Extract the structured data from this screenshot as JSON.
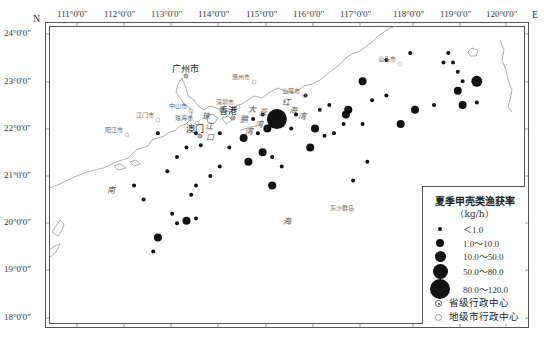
{
  "map": {
    "north_label": "N",
    "east_label": "E",
    "lon_ticks": [
      {
        "label": "111°0'0\"",
        "x": 77
      },
      {
        "label": "112°0'0\"",
        "x": 124
      },
      {
        "label": "113°0'0\"",
        "x": 171
      },
      {
        "label": "114°0'0\"",
        "x": 218
      },
      {
        "label": "115°0'0\"",
        "x": 266
      },
      {
        "label": "116°0'0\"",
        "x": 313
      },
      {
        "label": "117°0'0\"",
        "x": 360
      },
      {
        "label": "118°0'0\"",
        "x": 413
      },
      {
        "label": "119°0'0\"",
        "x": 460
      },
      {
        "label": "120°0'0\"",
        "x": 506
      }
    ],
    "lat_ticks": [
      {
        "label": "24°0'0\"",
        "y": 34
      },
      {
        "label": "23°0'0\"",
        "y": 82
      },
      {
        "label": "22°0'0\"",
        "y": 129
      },
      {
        "label": "21°0'0\"",
        "y": 176
      },
      {
        "label": "20°0'0\"",
        "y": 223
      },
      {
        "label": "19°0'0\"",
        "y": 270
      },
      {
        "label": "18°0'0\"",
        "y": 318
      }
    ],
    "cities": [
      {
        "name": "广州市",
        "x": 172,
        "y": 62,
        "type": "provincial",
        "big": true
      },
      {
        "name": "惠州市",
        "x": 232,
        "y": 72,
        "type": "prefecture",
        "big": false
      },
      {
        "name": "汕尾市",
        "x": 282,
        "y": 86,
        "type": "prefecture",
        "big": false
      },
      {
        "name": "汕头市",
        "x": 378,
        "y": 54,
        "type": "prefecture",
        "big": false
      },
      {
        "name": "深圳市",
        "x": 216,
        "y": 97,
        "type": "prefecture",
        "big": false
      },
      {
        "name": "中山市",
        "x": 169,
        "y": 101,
        "type": "prefecture",
        "big": false
      },
      {
        "name": "江门市",
        "x": 136,
        "y": 110,
        "type": "prefecture",
        "big": false
      },
      {
        "name": "珠海市",
        "x": 175,
        "y": 113,
        "type": "prefecture",
        "big": false
      },
      {
        "name": "香港",
        "x": 219,
        "y": 104,
        "type": "provincial",
        "big": true
      },
      {
        "name": "澳门",
        "x": 186,
        "y": 122,
        "type": "provincial",
        "big": true
      },
      {
        "name": "阳江市",
        "x": 105,
        "y": 125,
        "type": "prefecture",
        "big": false
      },
      {
        "name": "东沙群岛",
        "x": 330,
        "y": 203,
        "type": "island",
        "big": false
      }
    ],
    "sea_labels": [
      {
        "text": "南",
        "x": 107,
        "y": 184
      },
      {
        "text": "海",
        "x": 283,
        "y": 215
      },
      {
        "text": "珠",
        "x": 202,
        "y": 110
      },
      {
        "text": "江",
        "x": 205,
        "y": 120
      },
      {
        "text": "口",
        "x": 206,
        "y": 131
      },
      {
        "text": "大",
        "x": 248,
        "y": 103
      },
      {
        "text": "亚",
        "x": 259,
        "y": 106
      },
      {
        "text": "湾",
        "x": 255,
        "y": 118
      },
      {
        "text": "鹏",
        "x": 240,
        "y": 113
      },
      {
        "text": "湾",
        "x": 245,
        "y": 125
      },
      {
        "text": "红",
        "x": 282,
        "y": 96
      },
      {
        "text": "海",
        "x": 289,
        "y": 104
      },
      {
        "text": "湾",
        "x": 298,
        "y": 110
      }
    ]
  },
  "chart_data": {
    "type": "scatter",
    "title": "夏季甲壳类渔获率",
    "unit": "kg/h",
    "xlabel": "Longitude (°E)",
    "ylabel": "Latitude (°N)",
    "xlim": [
      110.4,
      120.3
    ],
    "ylim": [
      17.7,
      24.2
    ],
    "size_classes": [
      "<1.0",
      "1.0~10.0",
      "10.0~50.0",
      "50.0~80.0",
      "80.0~120.0"
    ],
    "stations": [
      {
        "lon": 115.2,
        "lat": 22.2,
        "class": "80.0~120.0"
      },
      {
        "lon": 119.4,
        "lat": 23.0,
        "class": "10.0~50.0"
      },
      {
        "lon": 119.0,
        "lat": 22.8,
        "class": "1.0~10.0"
      },
      {
        "lon": 119.1,
        "lat": 22.5,
        "class": "1.0~10.0"
      },
      {
        "lon": 118.5,
        "lat": 22.5,
        "class": "<1.0"
      },
      {
        "lon": 119.4,
        "lat": 22.55,
        "class": "<1.0"
      },
      {
        "lon": 119.0,
        "lat": 23.2,
        "class": "<1.0"
      },
      {
        "lon": 119.1,
        "lat": 23.0,
        "class": "<1.0"
      },
      {
        "lon": 118.7,
        "lat": 23.4,
        "class": "<1.0"
      },
      {
        "lon": 118.8,
        "lat": 23.6,
        "class": "<1.0"
      },
      {
        "lon": 118.9,
        "lat": 23.4,
        "class": "<1.0"
      },
      {
        "lon": 118.0,
        "lat": 23.6,
        "class": "<1.0"
      },
      {
        "lon": 117.5,
        "lat": 23.45,
        "class": "<1.0"
      },
      {
        "lon": 117.0,
        "lat": 23.0,
        "class": "1.0~10.0"
      },
      {
        "lon": 117.5,
        "lat": 22.7,
        "class": "<1.0"
      },
      {
        "lon": 117.8,
        "lat": 22.1,
        "class": "1.0~10.0"
      },
      {
        "lon": 118.1,
        "lat": 22.4,
        "class": "1.0~10.0"
      },
      {
        "lon": 117.2,
        "lat": 22.6,
        "class": "<1.0"
      },
      {
        "lon": 116.7,
        "lat": 22.4,
        "class": "1.0~10.0"
      },
      {
        "lon": 116.65,
        "lat": 22.3,
        "class": "1.0~10.0"
      },
      {
        "lon": 116.3,
        "lat": 22.5,
        "class": "<1.0"
      },
      {
        "lon": 116.0,
        "lat": 22.0,
        "class": "1.0~10.0"
      },
      {
        "lon": 116.6,
        "lat": 22.1,
        "class": "<1.0"
      },
      {
        "lon": 116.4,
        "lat": 21.9,
        "class": "<1.0"
      },
      {
        "lon": 117.0,
        "lat": 22.1,
        "class": "<1.0"
      },
      {
        "lon": 116.1,
        "lat": 22.4,
        "class": "<1.0"
      },
      {
        "lon": 115.8,
        "lat": 22.7,
        "class": "<1.0"
      },
      {
        "lon": 115.6,
        "lat": 22.3,
        "class": "<1.0"
      },
      {
        "lon": 115.9,
        "lat": 21.6,
        "class": "1.0~10.0"
      },
      {
        "lon": 115.5,
        "lat": 22.0,
        "class": "<1.0"
      },
      {
        "lon": 115.0,
        "lat": 22.0,
        "class": "1.0~10.0"
      },
      {
        "lon": 114.8,
        "lat": 21.9,
        "class": "<1.0"
      },
      {
        "lon": 114.9,
        "lat": 22.3,
        "class": "<1.0"
      },
      {
        "lon": 114.7,
        "lat": 22.2,
        "class": "<1.0"
      },
      {
        "lon": 114.5,
        "lat": 21.8,
        "class": "1.0~10.0"
      },
      {
        "lon": 114.9,
        "lat": 21.5,
        "class": "1.0~10.0"
      },
      {
        "lon": 114.6,
        "lat": 21.3,
        "class": "1.0~10.0"
      },
      {
        "lon": 115.1,
        "lat": 21.4,
        "class": "<1.0"
      },
      {
        "lon": 115.1,
        "lat": 20.8,
        "class": "1.0~10.0"
      },
      {
        "lon": 114.2,
        "lat": 21.6,
        "class": "<1.0"
      },
      {
        "lon": 114.0,
        "lat": 21.2,
        "class": "<1.0"
      },
      {
        "lon": 114.0,
        "lat": 21.9,
        "class": "<1.0"
      },
      {
        "lon": 113.8,
        "lat": 21.0,
        "class": "<1.0"
      },
      {
        "lon": 113.5,
        "lat": 20.8,
        "class": "<1.0"
      },
      {
        "lon": 113.4,
        "lat": 20.6,
        "class": "<1.0"
      },
      {
        "lon": 113.3,
        "lat": 20.05,
        "class": "1.0~10.0"
      },
      {
        "lon": 113.5,
        "lat": 20.1,
        "class": "<1.0"
      },
      {
        "lon": 113.0,
        "lat": 20.2,
        "class": "<1.0"
      },
      {
        "lon": 113.1,
        "lat": 20.0,
        "class": "<1.0"
      },
      {
        "lon": 112.7,
        "lat": 19.7,
        "class": "1.0~10.0"
      },
      {
        "lon": 112.6,
        "lat": 19.4,
        "class": "<1.0"
      },
      {
        "lon": 112.4,
        "lat": 20.5,
        "class": "<1.0"
      },
      {
        "lon": 112.2,
        "lat": 20.8,
        "class": "<1.0"
      },
      {
        "lon": 112.9,
        "lat": 21.1,
        "class": "<1.0"
      },
      {
        "lon": 113.1,
        "lat": 21.4,
        "class": "<1.0"
      },
      {
        "lon": 113.3,
        "lat": 21.6,
        "class": "<1.0"
      },
      {
        "lon": 113.6,
        "lat": 21.65,
        "class": "<1.0"
      },
      {
        "lon": 113.5,
        "lat": 21.9,
        "class": "<1.0"
      },
      {
        "lon": 112.7,
        "lat": 21.9,
        "class": "<1.0"
      },
      {
        "lon": 115.3,
        "lat": 21.2,
        "class": "<1.0"
      },
      {
        "lon": 116.2,
        "lat": 21.85,
        "class": "<1.0"
      },
      {
        "lon": 117.1,
        "lat": 21.3,
        "class": "<1.0"
      },
      {
        "lon": 116.8,
        "lat": 20.9,
        "class": "<1.0"
      }
    ]
  },
  "legend": {
    "title": "夏季甲壳类渔获率",
    "unit": "（kg/h）",
    "classes": [
      {
        "label": "＜1.0",
        "size": 4
      },
      {
        "label": "1.0～10.0",
        "size": 8
      },
      {
        "label": "10.0～50.0",
        "size": 11
      },
      {
        "label": "50.0～80.0",
        "size": 15
      },
      {
        "label": "80.0～120.0",
        "size": 20
      }
    ],
    "provincial_label": "省级行政中心",
    "prefecture_label": "地级市行政中心"
  },
  "colors": {
    "dot": "#111111",
    "coast": "#888888",
    "frame": "#555555"
  }
}
